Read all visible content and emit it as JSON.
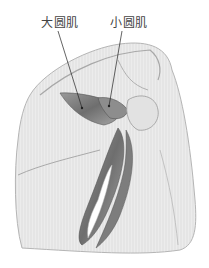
{
  "figure": {
    "labels": [
      {
        "id": "teres-major",
        "text": "大圆肌",
        "x": 41,
        "y": 16,
        "pointer": [
          82,
          108
        ]
      },
      {
        "id": "teres-minor",
        "text": "小圆肌",
        "x": 110,
        "y": 16,
        "pointer": [
          109,
          106
        ]
      }
    ],
    "colors": {
      "background": "#ffffff",
      "skin_light": "#e9e9e9",
      "skin_shade": "#cfcfcf",
      "muscle_dark": "#6a6a6a",
      "muscle_mid": "#8f8f8f",
      "outline": "#9a9a9a",
      "label_text": "#444444",
      "leader_line": "#222222"
    }
  }
}
